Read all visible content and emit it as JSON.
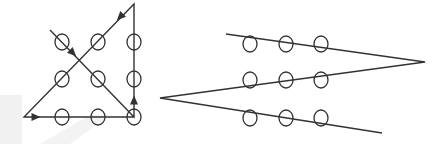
{
  "diagram": {
    "title": "",
    "puzzle": "nine-dot puzzle solutions",
    "colors": {
      "stroke": "#333333",
      "background": "#ffffff",
      "watermark": "#eeeeee"
    },
    "left_solution": {
      "description": "four-line solution with arrows",
      "dots": [
        [
          62,
          42
        ],
        [
          98,
          42
        ],
        [
          134,
          42
        ],
        [
          62,
          79
        ],
        [
          98,
          79
        ],
        [
          134,
          79
        ],
        [
          62,
          117
        ],
        [
          98,
          117
        ],
        [
          134,
          117
        ]
      ],
      "path": [
        [
          50,
          30
        ],
        [
          134,
          117
        ],
        [
          134,
          4
        ],
        [
          24,
          117
        ],
        [
          134,
          117
        ]
      ],
      "arrows": [
        "down-right on first diagonal",
        "up on right edge",
        "down-left on second diagonal",
        "right on bottom edge"
      ]
    },
    "right_solution": {
      "description": "three-line zig-zag solution",
      "dots": [
        [
          250,
          44
        ],
        [
          286,
          44
        ],
        [
          321,
          44
        ],
        [
          250,
          80
        ],
        [
          286,
          80
        ],
        [
          321,
          80
        ],
        [
          250,
          118
        ],
        [
          286,
          118
        ],
        [
          321,
          118
        ]
      ],
      "path": [
        [
          226,
          34
        ],
        [
          425,
          62
        ],
        [
          160,
          98
        ],
        [
          382,
          133
        ]
      ]
    }
  }
}
